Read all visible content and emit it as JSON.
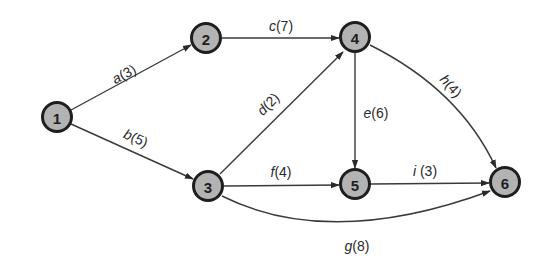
{
  "diagram": {
    "type": "directed-network",
    "colors": {
      "node_fill": "#b3b3b3",
      "node_stroke": "#1e1e1e",
      "edge": "#3a3a3a",
      "background": "#ffffff"
    },
    "nodes": [
      {
        "id": "1",
        "label": "1",
        "x": 57,
        "y": 117
      },
      {
        "id": "2",
        "label": "2",
        "x": 206,
        "y": 38
      },
      {
        "id": "3",
        "label": "3",
        "x": 208,
        "y": 186
      },
      {
        "id": "4",
        "label": "4",
        "x": 355,
        "y": 37
      },
      {
        "id": "5",
        "label": "5",
        "x": 355,
        "y": 184
      },
      {
        "id": "6",
        "label": "6",
        "x": 505,
        "y": 182
      }
    ],
    "edges": [
      {
        "id": "a",
        "from": "1",
        "to": "2",
        "name": "a",
        "weight": "3",
        "label": "a(3)"
      },
      {
        "id": "b",
        "from": "1",
        "to": "3",
        "name": "b",
        "weight": "5",
        "label": "b(5)"
      },
      {
        "id": "c",
        "from": "2",
        "to": "4",
        "name": "c",
        "weight": "7",
        "label": "c(7)"
      },
      {
        "id": "d",
        "from": "3",
        "to": "4",
        "name": "d",
        "weight": "2",
        "label": "d(2)"
      },
      {
        "id": "e",
        "from": "4",
        "to": "5",
        "name": "e",
        "weight": "6",
        "label": "e(6)"
      },
      {
        "id": "f",
        "from": "3",
        "to": "5",
        "name": "f",
        "weight": "4",
        "label": "f(4)"
      },
      {
        "id": "g",
        "from": "3",
        "to": "6",
        "name": "g",
        "weight": "8",
        "label": "g(8)"
      },
      {
        "id": "h",
        "from": "4",
        "to": "6",
        "name": "h",
        "weight": "4",
        "label": "h(4)"
      },
      {
        "id": "i",
        "from": "5",
        "to": "6",
        "name": "i",
        "weight": "3",
        "label": "i (3)"
      }
    ]
  }
}
